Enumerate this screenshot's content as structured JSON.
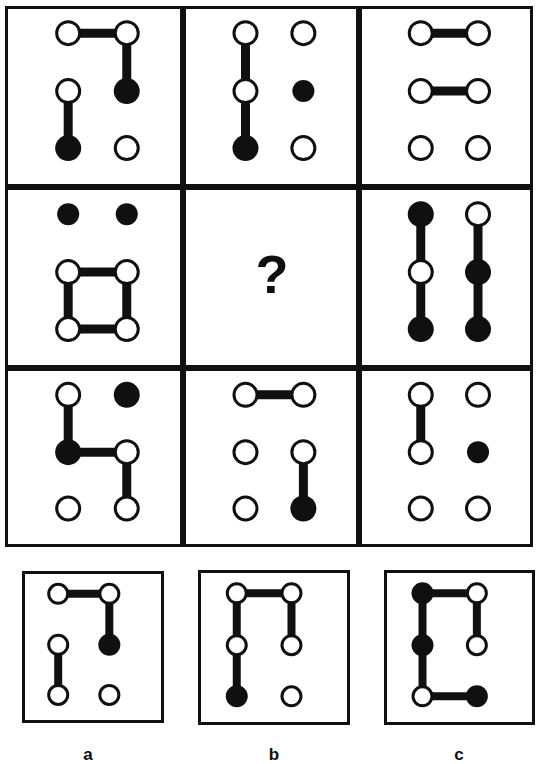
{
  "page": {
    "title": "Matrix reasoning puzzle — node-and-link figures",
    "background_color": "#ffffff",
    "ink_color": "#101010",
    "width": 541,
    "height": 764
  },
  "matrix": {
    "rows": 3,
    "cols": 3,
    "frame": {
      "x": 5,
      "y": 6,
      "width": 528,
      "height": 541,
      "stroke_width": 3
    },
    "node": {
      "radius": 13,
      "small_radius": 11,
      "stroke_width": 3,
      "link_width": 9
    },
    "cells": [
      {
        "id": "cell-r1c1",
        "row": 1,
        "col": 1,
        "box": {
          "x": 5,
          "y": 6,
          "width": 178,
          "height": 181
        },
        "nodes": [
          {
            "r": 1,
            "c": 1,
            "fill": "open"
          },
          {
            "r": 1,
            "c": 2,
            "fill": "open"
          },
          {
            "r": 2,
            "c": 1,
            "fill": "open"
          },
          {
            "r": 2,
            "c": 2,
            "fill": "filled"
          },
          {
            "r": 3,
            "c": 1,
            "fill": "filled"
          },
          {
            "r": 3,
            "c": 2,
            "fill": "open"
          }
        ],
        "links": [
          {
            "from": "1,1",
            "to": "1,2"
          },
          {
            "from": "1,2",
            "to": "2,2"
          },
          {
            "from": "2,1",
            "to": "3,1"
          }
        ]
      },
      {
        "id": "cell-r1c2",
        "row": 1,
        "col": 2,
        "box": {
          "x": 183,
          "y": 6,
          "width": 176,
          "height": 181
        },
        "nodes": [
          {
            "r": 1,
            "c": 1,
            "fill": "open"
          },
          {
            "r": 1,
            "c": 2,
            "fill": "open"
          },
          {
            "r": 2,
            "c": 1,
            "fill": "open"
          },
          {
            "r": 2,
            "c": 2,
            "fill": "filled",
            "small": true
          },
          {
            "r": 3,
            "c": 1,
            "fill": "filled"
          },
          {
            "r": 3,
            "c": 2,
            "fill": "open"
          }
        ],
        "links": [
          {
            "from": "1,1",
            "to": "2,1"
          },
          {
            "from": "2,1",
            "to": "3,1"
          }
        ]
      },
      {
        "id": "cell-r1c3",
        "row": 1,
        "col": 3,
        "box": {
          "x": 359,
          "y": 6,
          "width": 174,
          "height": 181
        },
        "nodes": [
          {
            "r": 1,
            "c": 1,
            "fill": "open"
          },
          {
            "r": 1,
            "c": 2,
            "fill": "open"
          },
          {
            "r": 2,
            "c": 1,
            "fill": "open"
          },
          {
            "r": 2,
            "c": 2,
            "fill": "open"
          },
          {
            "r": 3,
            "c": 1,
            "fill": "open"
          },
          {
            "r": 3,
            "c": 2,
            "fill": "open"
          }
        ],
        "links": [
          {
            "from": "1,1",
            "to": "1,2"
          },
          {
            "from": "2,1",
            "to": "2,2"
          }
        ]
      },
      {
        "id": "cell-r2c1",
        "row": 2,
        "col": 1,
        "box": {
          "x": 5,
          "y": 187,
          "width": 178,
          "height": 181
        },
        "nodes": [
          {
            "r": 1,
            "c": 1,
            "fill": "filled",
            "small": true
          },
          {
            "r": 1,
            "c": 2,
            "fill": "filled",
            "small": true
          },
          {
            "r": 2,
            "c": 1,
            "fill": "open"
          },
          {
            "r": 2,
            "c": 2,
            "fill": "open"
          },
          {
            "r": 3,
            "c": 1,
            "fill": "open"
          },
          {
            "r": 3,
            "c": 2,
            "fill": "open"
          }
        ],
        "links": [
          {
            "from": "2,1",
            "to": "2,2"
          },
          {
            "from": "2,1",
            "to": "3,1"
          },
          {
            "from": "2,2",
            "to": "3,2"
          },
          {
            "from": "3,1",
            "to": "3,2"
          }
        ]
      },
      {
        "id": "cell-r2c2",
        "row": 2,
        "col": 2,
        "box": {
          "x": 183,
          "y": 187,
          "width": 176,
          "height": 181
        },
        "is_question": true,
        "question_mark": "?",
        "nodes": [],
        "links": []
      },
      {
        "id": "cell-r2c3",
        "row": 2,
        "col": 3,
        "box": {
          "x": 359,
          "y": 187,
          "width": 174,
          "height": 181
        },
        "nodes": [
          {
            "r": 1,
            "c": 1,
            "fill": "filled"
          },
          {
            "r": 1,
            "c": 2,
            "fill": "open"
          },
          {
            "r": 2,
            "c": 1,
            "fill": "open"
          },
          {
            "r": 2,
            "c": 2,
            "fill": "filled"
          },
          {
            "r": 3,
            "c": 1,
            "fill": "filled"
          },
          {
            "r": 3,
            "c": 2,
            "fill": "filled"
          }
        ],
        "links": [
          {
            "from": "1,1",
            "to": "2,1"
          },
          {
            "from": "2,1",
            "to": "3,1"
          },
          {
            "from": "1,2",
            "to": "2,2"
          },
          {
            "from": "2,2",
            "to": "3,2"
          }
        ]
      },
      {
        "id": "cell-r3c1",
        "row": 3,
        "col": 1,
        "box": {
          "x": 5,
          "y": 368,
          "width": 178,
          "height": 179
        },
        "nodes": [
          {
            "r": 1,
            "c": 1,
            "fill": "open"
          },
          {
            "r": 1,
            "c": 2,
            "fill": "filled"
          },
          {
            "r": 2,
            "c": 1,
            "fill": "filled"
          },
          {
            "r": 2,
            "c": 2,
            "fill": "open"
          },
          {
            "r": 3,
            "c": 1,
            "fill": "open"
          },
          {
            "r": 3,
            "c": 2,
            "fill": "open"
          }
        ],
        "links": [
          {
            "from": "1,1",
            "to": "2,1"
          },
          {
            "from": "2,1",
            "to": "2,2"
          },
          {
            "from": "2,2",
            "to": "3,2"
          }
        ]
      },
      {
        "id": "cell-r3c2",
        "row": 3,
        "col": 2,
        "box": {
          "x": 183,
          "y": 368,
          "width": 176,
          "height": 179
        },
        "nodes": [
          {
            "r": 1,
            "c": 1,
            "fill": "open"
          },
          {
            "r": 1,
            "c": 2,
            "fill": "open"
          },
          {
            "r": 2,
            "c": 1,
            "fill": "open"
          },
          {
            "r": 2,
            "c": 2,
            "fill": "open"
          },
          {
            "r": 3,
            "c": 1,
            "fill": "open"
          },
          {
            "r": 3,
            "c": 2,
            "fill": "filled"
          }
        ],
        "links": [
          {
            "from": "1,1",
            "to": "1,2"
          },
          {
            "from": "2,2",
            "to": "3,2"
          }
        ]
      },
      {
        "id": "cell-r3c3",
        "row": 3,
        "col": 3,
        "box": {
          "x": 359,
          "y": 368,
          "width": 174,
          "height": 179
        },
        "nodes": [
          {
            "r": 1,
            "c": 1,
            "fill": "open"
          },
          {
            "r": 1,
            "c": 2,
            "fill": "open"
          },
          {
            "r": 2,
            "c": 1,
            "fill": "open"
          },
          {
            "r": 2,
            "c": 2,
            "fill": "filled",
            "small": true
          },
          {
            "r": 3,
            "c": 1,
            "fill": "open"
          },
          {
            "r": 3,
            "c": 2,
            "fill": "open"
          }
        ],
        "links": [
          {
            "from": "1,1",
            "to": "2,1"
          }
        ]
      }
    ]
  },
  "options": {
    "node": {
      "radius": 11,
      "stroke_width": 3,
      "link_width": 8
    },
    "items": [
      {
        "id": "option-a",
        "label": "a",
        "box": {
          "x": 22,
          "y": 571,
          "width": 142,
          "height": 152
        },
        "label_pos": {
          "x": 88,
          "y": 760
        },
        "nodes": [
          {
            "r": 1,
            "c": 1,
            "fill": "open"
          },
          {
            "r": 1,
            "c": 2,
            "fill": "open"
          },
          {
            "r": 2,
            "c": 1,
            "fill": "open"
          },
          {
            "r": 2,
            "c": 2,
            "fill": "filled"
          },
          {
            "r": 3,
            "c": 1,
            "fill": "open"
          },
          {
            "r": 3,
            "c": 2,
            "fill": "open"
          }
        ],
        "links": [
          {
            "from": "1,1",
            "to": "1,2"
          },
          {
            "from": "1,2",
            "to": "2,2"
          },
          {
            "from": "2,1",
            "to": "3,1"
          }
        ]
      },
      {
        "id": "option-b",
        "label": "b",
        "box": {
          "x": 198,
          "y": 570,
          "width": 152,
          "height": 155
        },
        "label_pos": {
          "x": 274,
          "y": 760
        },
        "nodes": [
          {
            "r": 1,
            "c": 1,
            "fill": "open"
          },
          {
            "r": 1,
            "c": 2,
            "fill": "open"
          },
          {
            "r": 2,
            "c": 1,
            "fill": "open"
          },
          {
            "r": 2,
            "c": 2,
            "fill": "open"
          },
          {
            "r": 3,
            "c": 1,
            "fill": "filled"
          },
          {
            "r": 3,
            "c": 2,
            "fill": "open"
          }
        ],
        "links": [
          {
            "from": "1,1",
            "to": "1,2"
          },
          {
            "from": "1,1",
            "to": "2,1"
          },
          {
            "from": "2,1",
            "to": "3,1"
          },
          {
            "from": "1,2",
            "to": "2,2"
          }
        ]
      },
      {
        "id": "option-c",
        "label": "c",
        "box": {
          "x": 384,
          "y": 570,
          "width": 151,
          "height": 155
        },
        "label_pos": {
          "x": 459,
          "y": 760
        },
        "nodes": [
          {
            "r": 1,
            "c": 1,
            "fill": "filled"
          },
          {
            "r": 1,
            "c": 2,
            "fill": "open"
          },
          {
            "r": 2,
            "c": 1,
            "fill": "filled"
          },
          {
            "r": 2,
            "c": 2,
            "fill": "open"
          },
          {
            "r": 3,
            "c": 1,
            "fill": "open"
          },
          {
            "r": 3,
            "c": 2,
            "fill": "filled"
          }
        ],
        "links": [
          {
            "from": "1,1",
            "to": "1,2"
          },
          {
            "from": "1,1",
            "to": "2,1"
          },
          {
            "from": "2,1",
            "to": "3,1"
          },
          {
            "from": "1,2",
            "to": "2,2"
          },
          {
            "from": "3,1",
            "to": "3,2"
          }
        ]
      }
    ]
  }
}
